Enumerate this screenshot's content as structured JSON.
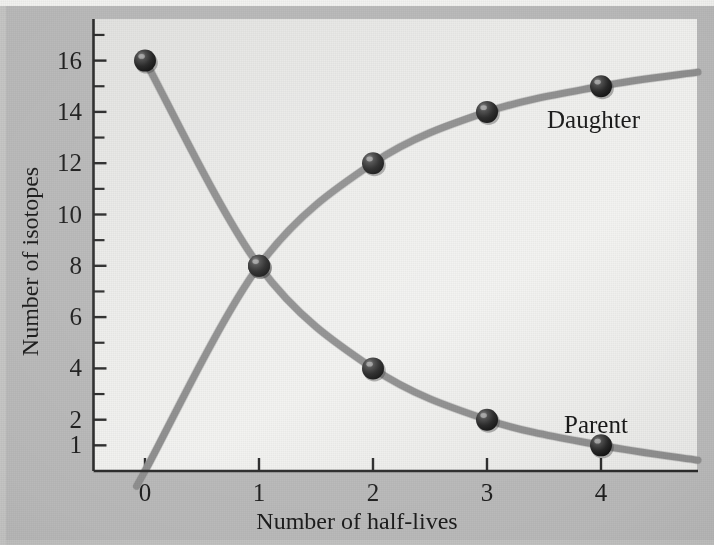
{
  "figure": {
    "name": "radioactive-decay-parent-daughter-isotopes"
  },
  "chart_data": {
    "type": "line",
    "title": "",
    "subtitle": "",
    "xlabel": "Number of half-lives",
    "ylabel": "Number of isotopes",
    "x": [
      0,
      1,
      2,
      3,
      4
    ],
    "xlim": [
      -0.27,
      4.85
    ],
    "ylim": [
      0,
      17.2
    ],
    "x_ticks": [
      0,
      1,
      2,
      3,
      4
    ],
    "x_tick_labels": [
      "0",
      "1",
      "2",
      "3",
      "4"
    ],
    "y_ticks": [
      1,
      2,
      3,
      4,
      5,
      6,
      7,
      8,
      9,
      10,
      11,
      12,
      13,
      14,
      15,
      16,
      17
    ],
    "y_tick_labels_shown": [
      "1",
      "2",
      "4",
      "6",
      "8",
      "10",
      "12",
      "14",
      "16"
    ],
    "y_labeled_values": [
      1,
      2,
      4,
      6,
      8,
      10,
      12,
      14,
      16
    ],
    "grid": false,
    "legend_position": "inline-annotation",
    "marker": "sphere",
    "marker_color": "#2a2a2a",
    "line_color": "#8e8e8e",
    "background_color": "#eeeeec",
    "outer_background_color": "#b9b9b9",
    "series": [
      {
        "name": "Parent",
        "label": "Parent",
        "values": [
          16,
          8,
          4,
          2,
          1
        ],
        "label_x": 4.0,
        "label_y": 2.1
      },
      {
        "name": "Daughter",
        "label": "Daughter",
        "values": [
          0,
          8,
          12,
          14,
          15
        ],
        "label_x": 3.55,
        "label_y": 13.0
      }
    ]
  }
}
